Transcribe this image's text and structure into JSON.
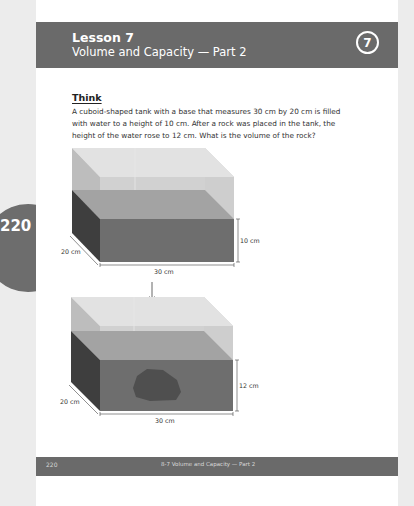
{
  "header": {
    "lesson_label": "Lesson 7",
    "lesson_title": "Volume and Capacity — Part 2",
    "lesson_number": "7"
  },
  "side_tab": {
    "page_number": "220"
  },
  "think": {
    "heading": "Think",
    "body": "A cuboid-shaped tank with a base that measures 30 cm by 20 cm is filled with water to a height of 10 cm. After a rock was placed in the tank, the height of the water rose to 12 cm. What is the volume of the rock?"
  },
  "diagrams": {
    "tank_before": {
      "width_label": "30 cm",
      "depth_label": "20 cm",
      "height_label": "10 cm"
    },
    "tank_after": {
      "width_label": "30 cm",
      "depth_label": "20 cm",
      "height_label": "12 cm"
    }
  },
  "footer": {
    "page_number": "220",
    "section_title": "8-7 Volume and Capacity — Part 2"
  },
  "colors": {
    "header_bg": "#6a6a6a",
    "page_bg": "#ffffff",
    "outer_bg": "#ececec",
    "water_front": "#6e6e6e",
    "water_side": "#3e3e3e",
    "rock": "#4f4f4f"
  }
}
